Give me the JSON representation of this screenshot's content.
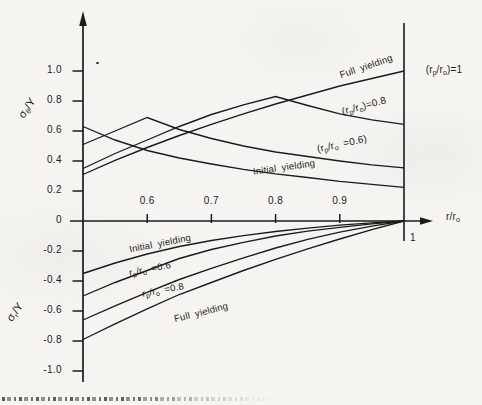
{
  "figure": {
    "background_color": "#f5f4f1",
    "line_color": "#1b1b1b"
  },
  "chart_data": {
    "type": "line",
    "title": "",
    "xlabel": "r/r_o",
    "ylabel_top": "σ_θ/Y",
    "ylabel_bottom": "σ_r/Y",
    "xlim": [
      0.5,
      1.0
    ],
    "ylim": [
      -1.0,
      1.1
    ],
    "grid": false,
    "legend": "inline-curve-labels",
    "x": [
      0.5,
      0.55,
      0.6,
      0.65,
      0.7,
      0.75,
      0.8,
      0.85,
      0.9,
      0.95,
      1.0
    ],
    "top": {
      "quantity": "σ_θ/Y (hoop stress)",
      "series": [
        {
          "name": "Initial yielding",
          "values": [
            0.63,
            0.54,
            0.47,
            0.42,
            0.38,
            0.345,
            0.315,
            0.29,
            0.265,
            0.245,
            0.225
          ]
        },
        {
          "name": "(r_p/r_o =0.6)",
          "values": [
            0.51,
            0.6,
            0.69,
            0.61,
            0.55,
            0.5,
            0.46,
            0.43,
            0.4,
            0.375,
            0.355
          ]
        },
        {
          "name": "(r_p/r_o)=0.8",
          "values": [
            0.35,
            0.45,
            0.54,
            0.63,
            0.71,
            0.775,
            0.83,
            0.77,
            0.715,
            0.675,
            0.645
          ]
        },
        {
          "name": "Full yielding (r_p/r_o)=1",
          "values": [
            0.31,
            0.405,
            0.49,
            0.57,
            0.645,
            0.715,
            0.78,
            0.84,
            0.9,
            0.95,
            1.0
          ]
        }
      ]
    },
    "bottom": {
      "quantity": "σ_r/Y (radial stress)",
      "series": [
        {
          "name": "Initial yielding",
          "values": [
            -0.35,
            -0.28,
            -0.22,
            -0.17,
            -0.13,
            -0.097,
            -0.07,
            -0.047,
            -0.028,
            -0.013,
            0
          ]
        },
        {
          "name": "r_p/r_o =0.6",
          "values": [
            -0.5,
            -0.41,
            -0.33,
            -0.25,
            -0.19,
            -0.142,
            -0.1,
            -0.068,
            -0.042,
            -0.019,
            0
          ]
        },
        {
          "name": "r_p/r_o =0.8",
          "values": [
            -0.66,
            -0.565,
            -0.475,
            -0.39,
            -0.315,
            -0.245,
            -0.18,
            -0.122,
            -0.074,
            -0.034,
            0
          ]
        },
        {
          "name": "Full yielding",
          "values": [
            -0.79,
            -0.685,
            -0.585,
            -0.49,
            -0.41,
            -0.33,
            -0.255,
            -0.185,
            -0.12,
            -0.058,
            0
          ]
        }
      ]
    },
    "y_ticks": [
      {
        "v": 1.0,
        "label": "1.0"
      },
      {
        "v": 0.8,
        "label": "0.8"
      },
      {
        "v": 0.6,
        "label": "0.6"
      },
      {
        "v": 0.4,
        "label": "0.4"
      },
      {
        "v": 0.2,
        "label": "0.2"
      },
      {
        "v": 0,
        "label": "0"
      },
      {
        "v": -0.2,
        "label": "-0.2"
      },
      {
        "v": -0.4,
        "label": "-0.4"
      },
      {
        "v": -0.6,
        "label": "-0.6"
      },
      {
        "v": -0.8,
        "label": "-0.8"
      },
      {
        "v": -1.0,
        "label": "-1.0"
      }
    ],
    "x_ticks": [
      {
        "v": 0.6,
        "label": "0.6"
      },
      {
        "v": 0.7,
        "label": "0.7"
      },
      {
        "v": 0.8,
        "label": "0.8"
      },
      {
        "v": 0.9,
        "label": "0.9"
      }
    ],
    "annotations": [
      {
        "text": "Full yielding",
        "x": 366,
        "y": 66,
        "rot": -19
      },
      {
        "text": "(r_p/r_o)=1",
        "x": 444,
        "y": 70,
        "rot": 0
      },
      {
        "text": "(r_p/r_o)=0.8",
        "x": 364,
        "y": 106,
        "rot": -15
      },
      {
        "text": "(r_p/r_o =0.6)",
        "x": 342,
        "y": 144,
        "rot": -12
      },
      {
        "text": "Initial yielding",
        "x": 284,
        "y": 167,
        "rot": -8
      },
      {
        "text": "Initial yielding",
        "x": 160,
        "y": 243,
        "rot": -11
      },
      {
        "text": "r_p/r_o =0.6",
        "x": 150,
        "y": 269,
        "rot": -11
      },
      {
        "text": "r_p/r_o =0.8",
        "x": 163,
        "y": 290,
        "rot": -11
      },
      {
        "text": "Full yielding",
        "x": 201,
        "y": 312,
        "rot": -14
      },
      {
        "text": "σ_θ/Y",
        "x": 27,
        "y": 108,
        "rot": -55
      },
      {
        "text": "σ_r/Y",
        "x": 15,
        "y": 312,
        "rot": -55
      },
      {
        "text": "r/r_o",
        "x": 453,
        "y": 217,
        "rot": 0
      },
      {
        "text": "1",
        "x": 413,
        "y": 237,
        "rot": 0
      }
    ]
  }
}
